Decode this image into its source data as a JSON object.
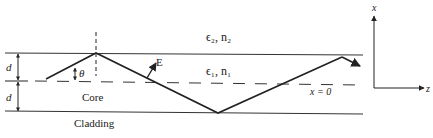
{
  "diagram": {
    "labels": {
      "upper_medium": "ϵ₂, n₂",
      "lower_medium": "ϵ₁, n₁",
      "core": "Core",
      "cladding": "Cladding",
      "field": "E",
      "angle": "θ",
      "half_thickness_top": "d",
      "half_thickness_bottom": "d",
      "center_line": "x = 0",
      "axis_vertical": "x",
      "axis_horizontal": "z"
    },
    "colors": {
      "line": "#222222",
      "background": "#ffffff"
    }
  }
}
